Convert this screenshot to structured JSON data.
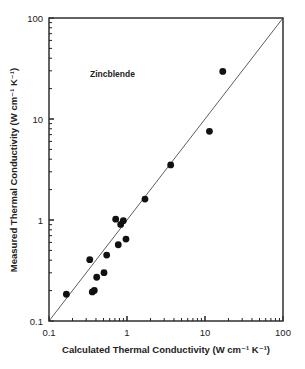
{
  "chart_data": {
    "type": "scatter",
    "title": "",
    "annotation": "Zincblende",
    "xlabel": "Calculated Thermal Conductivity (W cm⁻¹ K⁻¹)",
    "ylabel": "Measured Thermal Conductivity (W cm⁻¹ K⁻¹)",
    "xscale": "log",
    "yscale": "log",
    "xlim": [
      0.1,
      100
    ],
    "ylim": [
      0.1,
      100
    ],
    "x_ticks": [
      "0.1",
      "1",
      "10",
      "100"
    ],
    "y_ticks": [
      "0.1",
      "1",
      "10",
      "100"
    ],
    "grid": false,
    "legend": null,
    "reference_line": {
      "type": "y=x",
      "from": [
        0.1,
        0.1
      ],
      "to": [
        100,
        100
      ]
    },
    "series": [
      {
        "name": "Zincblende",
        "marker": "filled-circle",
        "color": "#111111",
        "points": [
          {
            "x": 0.167,
            "y": 0.184
          },
          {
            "x": 0.333,
            "y": 0.405
          },
          {
            "x": 0.359,
            "y": 0.194
          },
          {
            "x": 0.381,
            "y": 0.201
          },
          {
            "x": 0.409,
            "y": 0.271
          },
          {
            "x": 0.507,
            "y": 0.301
          },
          {
            "x": 0.549,
            "y": 0.45
          },
          {
            "x": 0.716,
            "y": 1.02
          },
          {
            "x": 0.773,
            "y": 0.569
          },
          {
            "x": 0.83,
            "y": 0.905
          },
          {
            "x": 0.897,
            "y": 0.984
          },
          {
            "x": 0.97,
            "y": 0.648
          },
          {
            "x": 1.7,
            "y": 1.61
          },
          {
            "x": 3.63,
            "y": 3.51
          },
          {
            "x": 11.4,
            "y": 7.55
          },
          {
            "x": 16.9,
            "y": 29.6
          }
        ]
      }
    ]
  }
}
